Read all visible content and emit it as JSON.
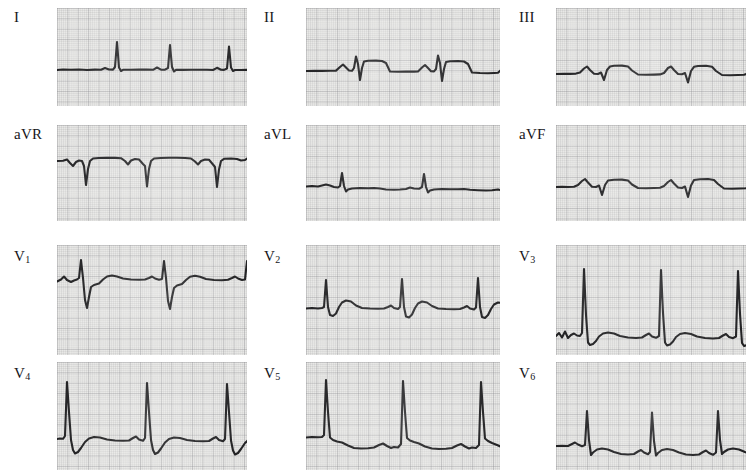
{
  "document": {
    "type": "12-lead electrocardiogram",
    "background_color": "#ffffff",
    "paper_color": "#e8e8e6",
    "grid_color": "#848488",
    "trace_color": "#1b1b1d",
    "columns": 3,
    "rows": 4
  },
  "chart_data": {
    "type": "line",
    "xlabel": "",
    "ylabel": "",
    "grid": true,
    "legend_position": "none",
    "paper_speed": "25 mm/s",
    "gain": "10 mm/mV",
    "small_box_px": 2.08,
    "large_box_px": 10.4,
    "series": [
      {
        "name": "I",
        "label": "I",
        "row": 0,
        "column": 0,
        "baseline_y": 62,
        "beats": 3,
        "morphology": "tall narrow R waves, flat isoelectric baseline, small T waves",
        "points": "0,62 6,61.5 14,61.8 22,61.5 30,62 38,61.6 44,61.8 48,60 52,61.5 56,61.6 58,59 60,34 62,59.5 64,63 66,61.8 74,61.8 82,61.6 90,61.6 96,61.8 100,59.5 104,61.6 108,61.7 111,60 113,37 115,59 117,63.5 119,61.9 126,61.9 134,61.8 142,61.8 150,61.7 156,62 160,59.8 164,61.8 167,61.9 170,60.5 172,38.5 174,59.5 176,63 178,62 184,62 190,61.9"
      },
      {
        "name": "II",
        "label": "II",
        "row": 0,
        "column": 1,
        "baseline_y": 64,
        "beats": 3,
        "morphology": "small P waves, rS complexes with elevated ST segments",
        "points": "0,63 8,62.8 16,62.9 24,62.8 30,62.6 34,59 37,56.5 40,59.5 43,62.5 46,62.8 48,60 50,48.5 52,56 54,72 56,60 58,53.5 62,52.8 70,52.6 76,53 80,55 84,63.5 92,63.8 100,63.6 108,63.6 112,63.4 116,59.5 119,57 122,60 125,63.2 128,63.4 130,61 132,47.5 134,55 136,73 138,61 140,54 144,53.2 152,53 158,53.5 162,56 166,64.5 174,65 182,65.2 188,65 192,64.8 196,61 199,58.5 202,62 205,65 208,65.2 210,63 212,49 214,57 216,75 218,63 220,56 224,55 230,54 236,53.8"
      },
      {
        "name": "III",
        "label": "III",
        "row": 0,
        "column": 2,
        "baseline_y": 66,
        "beats": 3,
        "morphology": "small biphasic P, qR with downsloping ST, deep S waves",
        "points": "0,66 8,65.8 14,65.9 20,65.6 24,64.5 28,60.5 31,58.5 34,62 38,65.8 42,66 45,64.5 48,72 51,62 54,58.5 58,57.8 66,57.6 72,58.5 76,62.5 82,66.5 90,66.8 98,66.6 104,66.4 108,65 112,60 115,58.5 118,62 122,66 126,66.2 129,65 132,74.5 135,63 138,58.8 142,58 150,57.8 156,58.8 160,63 166,67 174,67.2 182,67 188,66.8 192,65.5 196,60.5 199,58.8 202,62.5 206,66.5 210,67 213,65.5 216,76 219,64 222,59.5 228,58 234,57.5 240,57"
      },
      {
        "name": "aVR",
        "label": "aVR",
        "row": 1,
        "column": 0,
        "baseline_y": 36,
        "beats": 3,
        "morphology": "predominantly negative QS complexes, inverted P waves",
        "points": "0,36 6,35.8 10,34.5 13,38 16,41 19,37 22,35.5 25,36 27,41 29,60 31,44 33,36 36,33.5 42,33 50,32.8 58,32.9 64,33.2 68,36 71,39.5 74,35.5 78,34 82,34.5 86,39 88,41 90,61.5 92,44 94,36 97,33.5 104,33 112,32.8 120,32.8 128,33 134,33.5 138,36.5 141,39.5 144,36 148,34.5 152,34.8 156,39.5 158,42 160,62 162,44.5 164,36 167,33.8 174,33.5 180,34 184,35.5 188,35 190,33.5 192,33.2"
      },
      {
        "name": "aVL",
        "label": "aVL",
        "row": 1,
        "column": 1,
        "baseline_y": 62,
        "beats": 3,
        "morphology": "narrow tall R waves on flat baseline, small T waves",
        "points": "0,61.5 6,61 12,61.5 16,60.5 20,59.5 24,60.5 28,62 32,62.5 34,61 36,48 38,61 40,66.5 42,64.5 46,63.5 54,63 62,63.2 68,63 74,63.5 80,64.5 88,64.8 94,64.5 100,64 104,62.5 108,63.5 113,63.8 116,62 118,49 120,62 122,67.5 124,65.5 128,64.5 136,64 144,64.2 152,64.2 158,64 164,64.8 172,65.2 180,65.5 186,65.2 192,64.5 196,65.5 200,66 204,64.5 206,51.5 208,64 210,69 212,67 216,66 222,65.5 230,65 236,64.8"
      },
      {
        "name": "aVF",
        "label": "aVF",
        "row": 1,
        "column": 2,
        "baseline_y": 62,
        "beats": 3,
        "morphology": "P waves, rS with elevated downsloping ST segments",
        "points": "0,62 6,61.8 12,62 18,61.8 22,60 26,56 29,54 32,57.5 36,61.8 40,62 43,60.5 46,70 49,60 52,55.5 58,54.8 66,54.6 72,55.5 76,59.5 82,63 90,63.2 98,63 104,62.8 108,61 112,57 115,55 118,58.5 122,62.5 126,63 129,61.5 132,72 135,60.5 138,55 144,54.2 152,54 158,55 162,59 168,63.5 176,63.8 184,63.5 190,63.2 194,61.5 198,57 201,55 204,58.5 208,63 212,63.5 215,62 218,73 221,61 224,56 230,55 236,54.5 240,54.2"
      },
      {
        "name": "V1",
        "label": "V<sub>1</sub>",
        "row": 2,
        "column": 0,
        "baseline_y": 36,
        "beats": 3,
        "morphology": "rS complexes with deep S waves and broad positive T waves",
        "points": "0,36.5 4,34.5 7,31.5 10,35 14,37 17,35.5 20,34.5 22,33 24,15 26,33 28,55 30,63 32,52 34,42 37,40 42,38.5 46,34.5 50,31.5 55,30.5 60,31.5 66,33.5 74,34.5 82,34.8 88,34.5 92,33 95,31.5 98,33.5 102,34.8 105,34 107,16 109,33 111,56 113,64 115,52 117,43 120,40.5 125,39 129,35 133,31.8 138,30.8 143,31.8 149,34 157,35 165,35.2 171,34.8 175,33 178,31.5 181,33.5 185,35 188,34.5 190,16 192,32 194,56 196,64 198,52 200,43 203,40.5 208,39 214,38.5 220,38"
      },
      {
        "name": "V2",
        "label": "V<sub>2</sub>",
        "row": 2,
        "column": 1,
        "baseline_y": 64,
        "beats": 3,
        "morphology": "tall R waves with broad humped T waves",
        "points": "0,63.5 6,63 12,63.5 16,63 18,62 20,35 22,62 24,70 27,71 30,68.5 33,62 36,57.5 40,55.5 45,56.5 50,60.5 56,63 64,63.5 72,63.8 78,63.5 82,62 85,60.5 88,63 92,64 94,62 96,34 98,62 100,71.5 103,72.5 106,69.5 109,63 112,58.5 116,56.5 121,57.5 126,61 132,63.5 140,64 148,64.2 154,64 158,62.5 161,61 164,63.5 168,64.5 170,62.5 172,33 174,62 176,72 179,73 182,70 185,64 188,59.5 192,57.5 197,58 202,61"
      },
      {
        "name": "V3",
        "label": "V<sub>3</sub>",
        "row": 2,
        "column": 2,
        "beats": 3,
        "baseline_y": 92,
        "morphology": "very tall narrow R waves, rounded T waves, small notched P",
        "points": "0,91 3,88 6,92.5 9,86.5 12,93 15,90 18,88.5 21,90.5 24,91 26,88 28,24 30,70 32,97.5 34,100 37,99 40,96 43,91.5 47,88.5 52,87.5 58,88.5 64,91 72,92.5 80,93 86,92.5 90,90 93,88.5 96,91.5 100,92.8 103,91 105,25 107,68 109,97.5 111,100.5 114,99.5 117,96.5 120,92 124,89 129,88 135,89 141,91.5 149,93 157,93.5 163,93 167,90.5 170,89 173,92 177,93.2 180,91.5 182,26 184,69 186,98 188,101 191,100 194,97 198,93.5 203,92"
      },
      {
        "name": "V4",
        "label": "V<sub>4</sub>",
        "row": 3,
        "column": 0,
        "baseline_y": 78,
        "beats": 3,
        "morphology": "very tall R waves, deep narrow S, rounded T waves",
        "points": "0,77 3,76.5 6,76.8 8,74 10,20 12,50 14,78 16,88 18,91.5 21,90 24,86 28,80 32,76.5 37,75 43,75.5 50,77.5 58,78.5 66,78.8 72,78.5 76,76 79,74.5 82,77.5 86,78.8 88,76 90,21 92,50 94,78 96,88 98,92 101,90.5 104,86.5 108,80.5 112,77 117,75.5 123,76 130,78 138,79 146,79.2 152,79 156,76.5 159,75 162,78 166,79.2 168,77 170,22 172,50 174,78.5 176,88.5 178,92.5 181,91 184,87 188,81 192,77.5 197,76 203,76.5 209,77.5"
      },
      {
        "name": "V5",
        "label": "V<sub>5</sub>",
        "row": 3,
        "column": 1,
        "beats": 3,
        "baseline_y": 76,
        "morphology": "tall R waves with downsloping ST depression and flat T",
        "points": "0,75.5 6,75 12,75.2 16,75 18,73 20,18 22,50 24,75.5 27,78 31,79.5 36,80.5 42,83.5 48,86 55,86.5 62,86.2 68,85.5 73,83 77,81.5 81,84 85,86 88,85 92,85.5 95,82 97,19 99,50 101,76 104,78.5 108,80 113,81.5 119,84.5 126,86.5 133,87 140,86.8 146,86 151,83.5 155,82 159,84.5 163,86.5 166,85.5 170,86 173,83 175,20 177,50 179,76.5 182,79 186,81 191,83 197,85.5 203,87.5 209,88.5"
      },
      {
        "name": "V6",
        "label": "V<sub>6</sub>",
        "row": 3,
        "column": 2,
        "beats": 3,
        "baseline_y": 84,
        "morphology": "R waves with ST depression, small P waves, flat T",
        "points": "0,84 6,83.8 12,84 16,82 19,80.5 22,82.5 26,84.2 29,83 31,49 33,78 35,93 37,90.5 41,87.5 46,86.5 52,87.5 58,90 65,92 72,92.5 78,92 82,89.5 85,88 88,90.5 92,92.2 94,90 96,50.5 98,79 100,93.5 102,91 106,88 111,87 117,88 123,90.5 130,92.5 137,93 143,92.5 147,90 150,88.5 153,91 157,92.8 160,90.5 162,49 164,78 166,92 168,90 172,87.5 177,86.5 183,87.5 189,90 196,92"
      }
    ]
  }
}
